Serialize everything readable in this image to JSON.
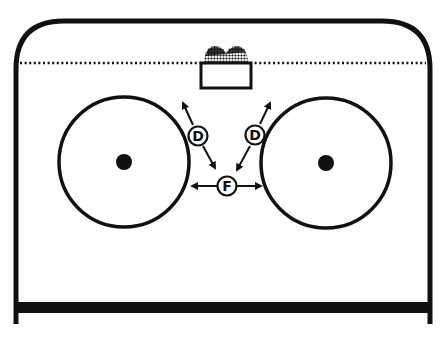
{
  "diagram": {
    "type": "hockey-rink-zone",
    "colors": {
      "line": "#111111",
      "background": "#ffffff"
    },
    "rink": {
      "boards": {
        "left": 16,
        "right": 430,
        "top": 21,
        "corner_radius": 48
      },
      "end_bar": {
        "y": 307,
        "thickness": 11,
        "left_ext": 16,
        "right_ext": 430,
        "post_bottom": 324
      },
      "blue_line_dotted_y": 63
    },
    "net": {
      "x": 200,
      "y": 63,
      "width": 52,
      "height": 25
    },
    "faceoff_circles": [
      {
        "id": "left-circle",
        "cx": 124,
        "cy": 162,
        "r": 65,
        "dot_r": 8
      },
      {
        "id": "right-circle",
        "cx": 326,
        "cy": 163,
        "r": 65,
        "dot_r": 8
      }
    ],
    "players": [
      {
        "id": "defense-left",
        "label": "D",
        "cx": 198,
        "cy": 136,
        "r": 9
      },
      {
        "id": "defense-right",
        "label": "D",
        "cx": 255,
        "cy": 135,
        "r": 9
      },
      {
        "id": "forward",
        "label": "F",
        "cx": 227,
        "cy": 186,
        "r": 9
      }
    ],
    "arrows": [
      {
        "id": "dl-up",
        "from": [
          193,
          125
        ],
        "to": [
          182,
          101
        ]
      },
      {
        "id": "dl-down",
        "from": [
          203,
          146
        ],
        "to": [
          216,
          170
        ]
      },
      {
        "id": "dr-up",
        "from": [
          260,
          124
        ],
        "to": [
          271,
          101
        ]
      },
      {
        "id": "dr-down",
        "from": [
          250,
          146
        ],
        "to": [
          236,
          172
        ]
      },
      {
        "id": "f-left",
        "from": [
          217,
          186
        ],
        "to": [
          190,
          186
        ]
      },
      {
        "id": "f-right",
        "from": [
          237,
          186
        ],
        "to": [
          263,
          186
        ]
      }
    ]
  }
}
